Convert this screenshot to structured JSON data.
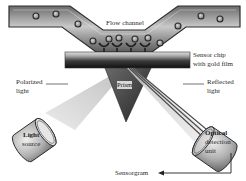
{
  "diagram": {
    "labels": {
      "flow_channel": "Flow channel",
      "sensor_chip_line1": "Sensor chip",
      "sensor_chip_line2": "with gold film",
      "polarized_line1": "Polarized",
      "polarized_line2": "light",
      "reflected_line1": "Reflected",
      "reflected_line2": "light",
      "prism": "Prism",
      "light_source_line1": "Light",
      "light_source_line2": "source",
      "detector_line1": "Optical",
      "detector_line2": "detection",
      "detector_line3": "unit",
      "sensorgram": "Sensorgram"
    },
    "components": [
      "flow-channel",
      "analyte-particles",
      "immobilized-ligands",
      "sensor-chip",
      "prism",
      "light-source",
      "incident-light-beam",
      "reflected-light-beam",
      "optical-detection-unit",
      "sensorgram-output-arrow"
    ],
    "colors": {
      "channel_dark": "#555555",
      "channel_light": "#b8b8b8",
      "chip_top": "#cfcfcf",
      "chip_bottom": "#1a1a1a",
      "prism": "#3a3a3a",
      "beam": "#d9d9d9",
      "cylinder": "#9a9a9a"
    }
  }
}
